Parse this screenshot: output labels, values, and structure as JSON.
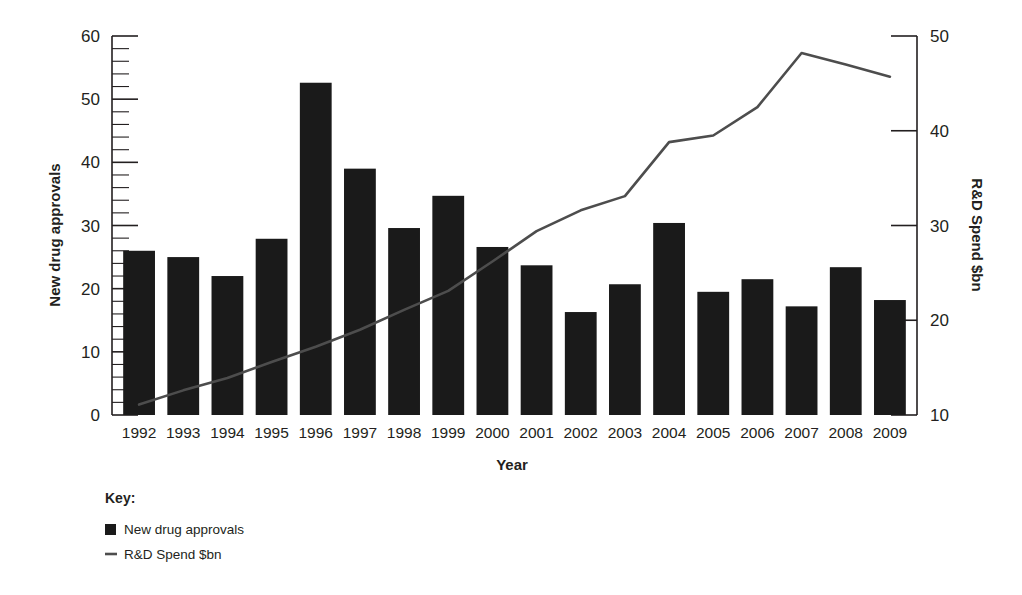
{
  "chart_data": {
    "type": "bar",
    "title": "",
    "xlabel": "Year",
    "ylabel": "New drug approvals",
    "y2label": "R&D Spend $bn",
    "categories": [
      "1992",
      "1993",
      "1994",
      "1995",
      "1996",
      "1997",
      "1998",
      "1999",
      "2000",
      "2001",
      "2002",
      "2003",
      "2004",
      "2005",
      "2006",
      "2007",
      "2008",
      "2009"
    ],
    "ylim": [
      0,
      60
    ],
    "y2lim": [
      10,
      50
    ],
    "yticks": [
      0,
      10,
      20,
      30,
      40,
      50,
      60
    ],
    "yticks_minor_step": 2,
    "y2ticks": [
      10,
      20,
      30,
      40,
      50
    ],
    "grid": false,
    "legend_position": "below-left",
    "series": [
      {
        "name": "New drug approvals",
        "kind": "bar",
        "axis": "left",
        "color": "#1a1a1a",
        "values": [
          26.0,
          25.0,
          22.0,
          27.9,
          52.6,
          39.0,
          29.6,
          34.7,
          26.6,
          23.7,
          16.3,
          20.7,
          30.4,
          19.5,
          21.5,
          17.2,
          23.4,
          18.2
        ]
      },
      {
        "name": "R&D Spend $bn",
        "kind": "line",
        "axis": "right",
        "color": "#4d4d4d",
        "values": [
          11.1,
          12.6,
          13.9,
          15.6,
          17.2,
          19.0,
          21.1,
          23.1,
          26.2,
          29.4,
          31.6,
          33.1,
          38.8,
          39.5,
          42.5,
          48.2,
          47.0,
          45.7
        ]
      }
    ]
  },
  "axes": {
    "left_title": "New drug approvals",
    "right_title": "R&D Spend $bn",
    "x_title": "Year"
  },
  "legend": {
    "heading": "Key:",
    "items": [
      {
        "label": "New drug approvals",
        "marker": "square-swatch-icon",
        "color": "#1a1a1a"
      },
      {
        "label": "R&D Spend $bn",
        "marker": "line-swatch-icon",
        "color": "#4d4d4d"
      }
    ]
  }
}
